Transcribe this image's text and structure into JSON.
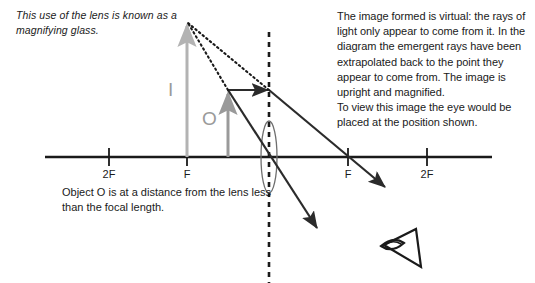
{
  "diagram": {
    "notes": {
      "magnifier": "This use of the lens is known as a magnifying glass.",
      "virtual_image": "The image formed is virtual: the rays of light only appear to come from it. In the diagram the emergent rays have been extrapolated back to the point they appear to come from. The image is upright and magnified.\nTo view this image the eye would be placed at the position shown.",
      "object_distance": "Object O is at a distance from the lens less than the focal length."
    },
    "axis_labels": [
      {
        "text": "2F",
        "x": 109
      },
      {
        "text": "F",
        "x": 187
      },
      {
        "text": "F",
        "x": 348
      },
      {
        "text": "2F",
        "x": 427
      }
    ],
    "object_label": "O",
    "image_label": "I",
    "colors": {
      "ink": "#1a1a1a",
      "ray": "#2b2b2b",
      "object_arrow": "#9a9a9a",
      "image_arrow": "#b3b3b3",
      "lens_outline": "#6e6e6e",
      "background": "#ffffff"
    },
    "geometry": {
      "axis": {
        "x1": 45,
        "x2": 492,
        "y": 157
      },
      "lens": {
        "cx": 269,
        "cy": 157,
        "rx": 8,
        "ry": 36
      },
      "principal_axis_dashed": {
        "x": 269,
        "y1": 32,
        "y2": 283
      },
      "object_arrow": {
        "x": 228,
        "y_base": 157,
        "y_tip": 90
      },
      "image_arrow": {
        "x": 187,
        "y_base": 157,
        "y_tip": 22
      },
      "incident_ray": {
        "x1": 228,
        "y1": 90,
        "x2": 269,
        "y2": 90
      },
      "refracted_ray_through_focus": {
        "x1": 269,
        "y1": 90,
        "x2": 388,
        "y2": 190
      },
      "central_ray": {
        "x1": 228,
        "y1": 90,
        "x2": 320,
        "y2": 232
      },
      "extrapolation_a": {
        "x1": 269,
        "y1": 90,
        "x2": 187,
        "y2": 22
      },
      "extrapolation_b": {
        "x1": 228,
        "y1": 90,
        "x2": 187,
        "y2": 22
      },
      "eye": {
        "x": 380,
        "y": 228,
        "w": 46,
        "h": 40
      }
    }
  }
}
